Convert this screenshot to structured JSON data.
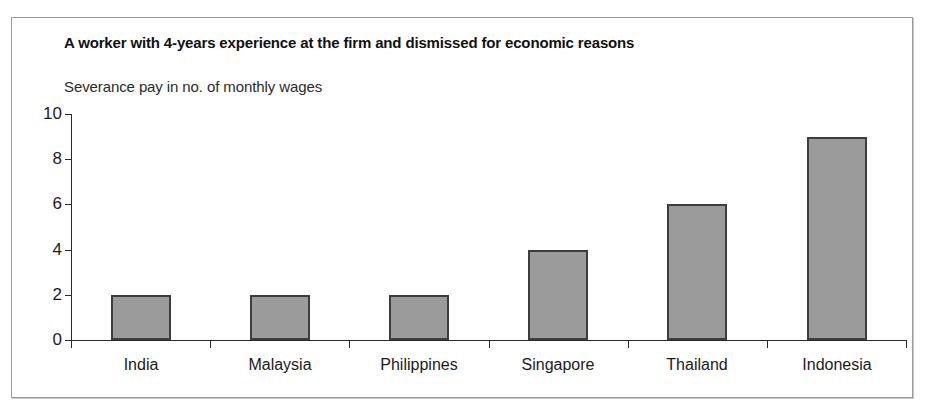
{
  "figure": {
    "title": "A worker with 4-years experience at the firm and dismissed for economic reasons",
    "subtitle": "Severance pay in no. of monthly wages"
  },
  "chart_data": {
    "type": "bar",
    "title": "A worker with 4-years experience at the firm and dismissed for economic reasons",
    "subtitle": "Severance pay in no. of monthly wages",
    "xlabel": "",
    "ylabel": "Severance pay in no. of monthly wages",
    "categories": [
      "India",
      "Malaysia",
      "Philippines",
      "Singapore",
      "Thailand",
      "Indonesia"
    ],
    "values": [
      2,
      2,
      2,
      4,
      6,
      9
    ],
    "ylim": [
      0,
      10
    ],
    "yticks": [
      0,
      2,
      4,
      6,
      8,
      10
    ],
    "ytick_labels": [
      "0",
      "2",
      "4",
      "6",
      "8",
      "10"
    ],
    "grid": false,
    "legend": false,
    "legend_position": "none",
    "colors": {
      "bar_fill": "#9b9b9b",
      "bar_edge": "#3d3d3d",
      "axis": "#2b2b2b",
      "frame": "#9a9a9a",
      "background": "#ffffff",
      "text": "#1b1b1b"
    }
  }
}
